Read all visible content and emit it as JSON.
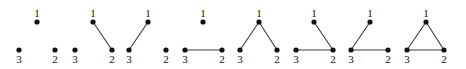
{
  "figure": {
    "type": "diagram",
    "graph_count": 8,
    "vertex_labels": [
      "1",
      "2",
      "3"
    ],
    "style": {
      "dot_color": "#111111",
      "edge_color": "#3a3a3a",
      "background": "#ffffff",
      "dot_radius": 2.6,
      "edge_width": 1.1
    },
    "graphs": [
      {
        "id": "graph-1",
        "edge_count": 0,
        "origin_x": 0,
        "vertices": [
          {
            "label": "1",
            "x": 37,
            "y": 22,
            "label_pos": "above"
          },
          {
            "label": "3",
            "x": 19,
            "y": 50,
            "label_pos": "below"
          },
          {
            "label": "2",
            "x": 55,
            "y": 50,
            "label_pos": "below"
          }
        ],
        "edges": []
      },
      {
        "id": "graph-2",
        "edge_count": 1,
        "origin_x": 0,
        "vertices": [
          {
            "label": "1",
            "x": 93,
            "y": 22,
            "label_pos": "above"
          },
          {
            "label": "3",
            "x": 75,
            "y": 50,
            "label_pos": "below"
          },
          {
            "label": "2",
            "x": 112,
            "y": 50,
            "label_pos": "below"
          }
        ],
        "edges": [
          [
            "1",
            "2"
          ]
        ]
      },
      {
        "id": "graph-3",
        "edge_count": 1,
        "origin_x": 0,
        "vertices": [
          {
            "label": "1",
            "x": 148,
            "y": 22,
            "label_pos": "above"
          },
          {
            "label": "3",
            "x": 129,
            "y": 50,
            "label_pos": "below"
          },
          {
            "label": "2",
            "x": 166,
            "y": 50,
            "label_pos": "below"
          }
        ],
        "edges": [
          [
            "3",
            "1"
          ]
        ]
      },
      {
        "id": "graph-4",
        "edge_count": 1,
        "origin_x": 0,
        "vertices": [
          {
            "label": "1",
            "x": 203,
            "y": 22,
            "label_pos": "above"
          },
          {
            "label": "3",
            "x": 185,
            "y": 50,
            "label_pos": "below"
          },
          {
            "label": "2",
            "x": 222,
            "y": 50,
            "label_pos": "below"
          }
        ],
        "edges": [
          [
            "3",
            "2"
          ]
        ]
      },
      {
        "id": "graph-5",
        "edge_count": 2,
        "origin_x": 0,
        "vertices": [
          {
            "label": "1",
            "x": 259,
            "y": 22,
            "label_pos": "above"
          },
          {
            "label": "3",
            "x": 240,
            "y": 50,
            "label_pos": "below"
          },
          {
            "label": "2",
            "x": 277,
            "y": 50,
            "label_pos": "below"
          }
        ],
        "edges": [
          [
            "3",
            "1"
          ],
          [
            "1",
            "2"
          ]
        ]
      },
      {
        "id": "graph-6",
        "edge_count": 2,
        "origin_x": 0,
        "vertices": [
          {
            "label": "1",
            "x": 314,
            "y": 22,
            "label_pos": "above"
          },
          {
            "label": "3",
            "x": 296,
            "y": 50,
            "label_pos": "below"
          },
          {
            "label": "2",
            "x": 333,
            "y": 50,
            "label_pos": "below"
          }
        ],
        "edges": [
          [
            "3",
            "2"
          ],
          [
            "1",
            "2"
          ]
        ]
      },
      {
        "id": "graph-7",
        "edge_count": 2,
        "origin_x": 0,
        "vertices": [
          {
            "label": "1",
            "x": 370,
            "y": 22,
            "label_pos": "above"
          },
          {
            "label": "3",
            "x": 351,
            "y": 50,
            "label_pos": "below"
          },
          {
            "label": "2",
            "x": 388,
            "y": 50,
            "label_pos": "below"
          }
        ],
        "edges": [
          [
            "3",
            "1"
          ],
          [
            "3",
            "2"
          ]
        ]
      },
      {
        "id": "graph-8",
        "edge_count": 3,
        "origin_x": 0,
        "vertices": [
          {
            "label": "1",
            "x": 426,
            "y": 22,
            "label_pos": "above"
          },
          {
            "label": "3",
            "x": 407,
            "y": 50,
            "label_pos": "below"
          },
          {
            "label": "2",
            "x": 444,
            "y": 50,
            "label_pos": "below"
          }
        ],
        "edges": [
          [
            "3",
            "1"
          ],
          [
            "1",
            "2"
          ],
          [
            "3",
            "2"
          ]
        ]
      }
    ]
  }
}
